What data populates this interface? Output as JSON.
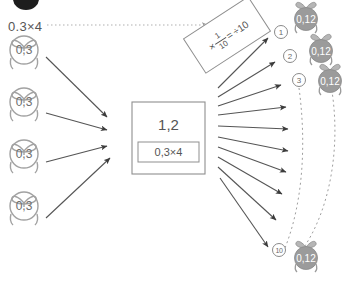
{
  "diagram": {
    "title_expression": "0.3×4",
    "center_box": {
      "result": "1,2",
      "expression": "0,3×4"
    },
    "rule_box": {
      "prefix": "×",
      "fraction_numerator": "1",
      "fraction_denominator": "10",
      "equals": "=",
      "suffix": "÷10"
    },
    "left_bags": [
      {
        "label": "0,3"
      },
      {
        "label": "0,3"
      },
      {
        "label": "0,3"
      },
      {
        "label": "0,3"
      }
    ],
    "right_bags": [
      {
        "label": "0,12"
      },
      {
        "label": "0,12"
      },
      {
        "label": "0,12"
      },
      {
        "label": "0,12"
      }
    ],
    "step_numbers": [
      {
        "label": "1"
      },
      {
        "label": "2"
      },
      {
        "label": "3"
      },
      {
        "label": "10"
      }
    ],
    "colors": {
      "outline": "#8f8f8f",
      "bag_fill_gray": "#9b9b9b",
      "arrow": "#555555",
      "text": "#4a4a4a",
      "blob": "#1d1d1d"
    },
    "icons": {
      "bag_light": "gift-bag-outline-icon",
      "bag_gray": "gift-bag-filled-icon",
      "arrow": "arrow-icon",
      "dotted_arrow": "dotted-arrow-icon",
      "dashed_curve": "dashed-curve-icon"
    }
  }
}
